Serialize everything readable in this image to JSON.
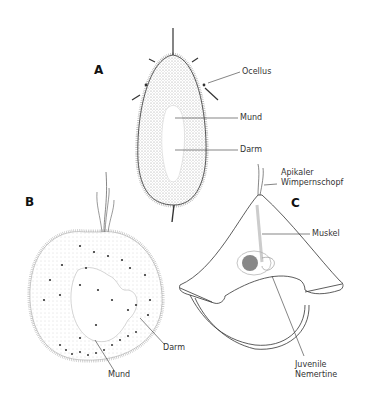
{
  "header": {
    "page_number": "272",
    "section": "Nemertini",
    "text": "272    Nemertini"
  },
  "figure": {
    "panels": [
      {
        "id": "A",
        "label": "A",
        "annotations": [
          "Ocellus",
          "Mund",
          "Darm"
        ]
      },
      {
        "id": "B",
        "label": "B",
        "annotations": [
          "Darm",
          "Mund"
        ]
      },
      {
        "id": "C",
        "label": "C",
        "annotations": [
          "Apikaler",
          "Wimpernschopf",
          "Muskel",
          "Juvenile",
          "Nemertine"
        ]
      }
    ],
    "labels": {
      "A": "A",
      "B": "B",
      "C": "C",
      "a_ocellus": "Ocellus",
      "a_mund": "Mund",
      "a_darm": "Darm",
      "b_darm": "Darm",
      "b_mund": "Mund",
      "c_apikaler": "Apikaler",
      "c_wimpernschopf": "Wimpernschopf",
      "c_muskel": "Muskel",
      "c_juvenile": "Juvenile",
      "c_nemertine": "Nemertine"
    }
  }
}
